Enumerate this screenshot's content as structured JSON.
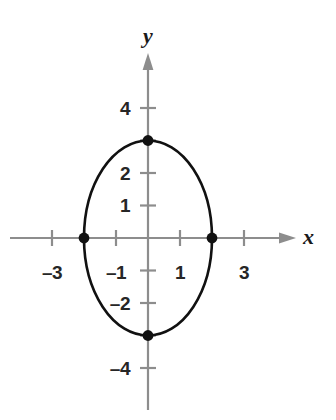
{
  "chart_data": {
    "type": "line",
    "title": "",
    "xlabel": "x",
    "ylabel": "y",
    "grid": false,
    "legend": "none",
    "xlim": [
      -4.6,
      4.4
    ],
    "ylim": [
      -5.6,
      5.6
    ],
    "x_ticks": [
      -3,
      -1,
      1,
      3
    ],
    "x_tick_labels": [
      "–3",
      "–1",
      "1",
      "3"
    ],
    "y_ticks": [
      -4,
      -2,
      1,
      2,
      4
    ],
    "y_tick_labels": [
      "–4",
      "–2",
      "1",
      "2",
      "4"
    ],
    "minor_x_ticks": [
      -2,
      2
    ],
    "minor_y_ticks": [
      -3,
      -1,
      3
    ],
    "curve": {
      "name": "ellipse",
      "equation": "x^2/4 + y^2/9 = 1",
      "semi_axis_x": 2,
      "semi_axis_y": 3,
      "center": [
        0,
        0
      ],
      "stroke": "#111111",
      "stroke_width": 2.6,
      "fill": "none"
    },
    "points": [
      {
        "label": "top-vertex",
        "x": 0,
        "y": 3
      },
      {
        "label": "right-co-vertex",
        "x": 2,
        "y": 0
      },
      {
        "label": "bottom-vertex",
        "x": 0,
        "y": -3
      },
      {
        "label": "left-co-vertex",
        "x": -2,
        "y": 0
      }
    ],
    "point_color": "#111111",
    "axis_color": "#8d8d8d"
  },
  "axes": {
    "x_name": "x",
    "y_name": "y"
  },
  "labels": {
    "y4": "4",
    "y2": "2",
    "y1": "1",
    "yneg2": "–2",
    "yneg4": "–4",
    "xneg3": "–3",
    "xneg1": "–1",
    "x1": "1",
    "x3": "3"
  }
}
